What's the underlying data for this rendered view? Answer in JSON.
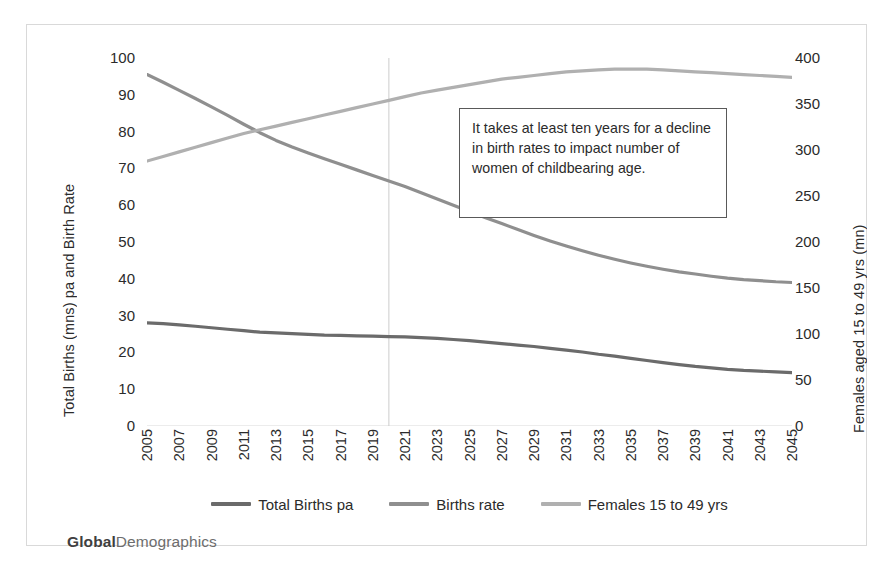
{
  "brand": {
    "bold": "Global",
    "regular": "Demographics"
  },
  "annotation": {
    "text": "It takes at least ten years for a decline in birth rates to impact number of women of childbearing age."
  },
  "legend": {
    "items": [
      {
        "label": "Total Births pa",
        "color": "#6b6b6b"
      },
      {
        "label": "Births rate",
        "color": "#8f8f8f"
      },
      {
        "label": "Females 15 to 49 yrs",
        "color": "#b0b0b0"
      }
    ]
  },
  "chart_data": {
    "type": "line",
    "title": "",
    "xlabel": "",
    "ylabel": "Total Births (mns) pa and Birth Rate",
    "y2label": "Females aged 15 to 49 yrs (mn)",
    "ylim": [
      0,
      100
    ],
    "y2lim": [
      0,
      400
    ],
    "yticks": [
      0,
      10,
      20,
      30,
      40,
      50,
      60,
      70,
      80,
      90,
      100
    ],
    "y2ticks": [
      0,
      50,
      100,
      150,
      200,
      250,
      300,
      350,
      400
    ],
    "grid": false,
    "legend_position": "bottom",
    "x": [
      2005,
      2006,
      2007,
      2008,
      2009,
      2010,
      2011,
      2012,
      2013,
      2014,
      2015,
      2016,
      2017,
      2018,
      2019,
      2020,
      2021,
      2022,
      2023,
      2024,
      2025,
      2026,
      2027,
      2028,
      2029,
      2030,
      2031,
      2032,
      2033,
      2034,
      2035,
      2036,
      2037,
      2038,
      2039,
      2040,
      2041,
      2042,
      2043,
      2044,
      2045
    ],
    "xtick_labels": [
      "2005",
      "2007",
      "2009",
      "2011",
      "2013",
      "2015",
      "2017",
      "2019",
      "2021",
      "2023",
      "2025",
      "2027",
      "2029",
      "2031",
      "2033",
      "2035",
      "2037",
      "2039",
      "2041",
      "2043",
      "2045"
    ],
    "annotations": [
      {
        "type": "vline",
        "x": 2020,
        "color": "#cccccc",
        "label": ""
      }
    ],
    "series": [
      {
        "name": "Total Births pa",
        "axis": "left",
        "color": "#6b6b6b",
        "units": "mns",
        "values": [
          28.0,
          27.8,
          27.5,
          27.1,
          26.7,
          26.3,
          25.9,
          25.5,
          25.3,
          25.1,
          24.9,
          24.7,
          24.6,
          24.5,
          24.4,
          24.3,
          24.2,
          24.0,
          23.8,
          23.5,
          23.2,
          22.8,
          22.4,
          22.0,
          21.6,
          21.1,
          20.6,
          20.1,
          19.5,
          19.0,
          18.4,
          17.8,
          17.2,
          16.7,
          16.2,
          15.8,
          15.4,
          15.1,
          14.9,
          14.7,
          14.5
        ]
      },
      {
        "name": "Births rate",
        "axis": "left",
        "color": "#8f8f8f",
        "units": "per 1000",
        "values": [
          95.5,
          93.4,
          91.2,
          89.0,
          86.7,
          84.4,
          82.0,
          79.7,
          77.6,
          75.8,
          74.2,
          72.6,
          71.1,
          69.6,
          68.1,
          66.6,
          65.1,
          63.4,
          61.7,
          60.0,
          58.3,
          56.6,
          55.0,
          53.4,
          51.8,
          50.3,
          48.9,
          47.6,
          46.4,
          45.3,
          44.3,
          43.4,
          42.6,
          41.9,
          41.3,
          40.7,
          40.2,
          39.8,
          39.5,
          39.2,
          39.0
        ]
      },
      {
        "name": "Females 15 to 49 yrs",
        "axis": "right",
        "color": "#b0b0b0",
        "units": "mn",
        "values": [
          288,
          293,
          298,
          303,
          308,
          313,
          318,
          322,
          326,
          330,
          334,
          338,
          342,
          346,
          350,
          354,
          358,
          362,
          365,
          368,
          371,
          374,
          377,
          379,
          381,
          383,
          385,
          386,
          387,
          388,
          388,
          388,
          387,
          386,
          385,
          384,
          383,
          382,
          381,
          380,
          379
        ]
      }
    ]
  }
}
